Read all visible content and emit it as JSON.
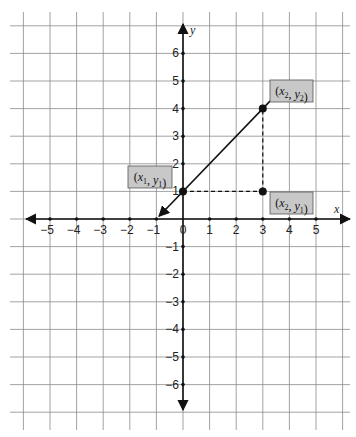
{
  "chart_data": {
    "type": "line",
    "title": "",
    "xlabel": "x",
    "ylabel": "y",
    "xlim": [
      -6,
      6
    ],
    "ylim": [
      -7,
      7
    ],
    "grid": true,
    "x_ticks": [
      "-5",
      "-4",
      "-3",
      "-2",
      "-1",
      "0",
      "1",
      "2",
      "3",
      "4",
      "5"
    ],
    "y_ticks_positive": [
      "1",
      "2",
      "3",
      "4",
      "5",
      "6"
    ],
    "y_ticks_negative": [
      "-1",
      "-2",
      "-3",
      "-4",
      "-5",
      "-6"
    ],
    "line": {
      "through": [
        [
          0,
          1
        ],
        [
          3,
          4
        ]
      ],
      "slope": 1,
      "arrows_both_ends": true
    },
    "points": [
      {
        "x": 0,
        "y": 1,
        "label_x": "x",
        "label_x_sub": "1",
        "label_y": "y",
        "label_y_sub": "1"
      },
      {
        "x": 3,
        "y": 4,
        "label_x": "x",
        "label_x_sub": "2",
        "label_y": "y",
        "label_y_sub": "2"
      },
      {
        "x": 3,
        "y": 1,
        "label_x": "x",
        "label_x_sub": "2",
        "label_y": "y",
        "label_y_sub": "1"
      }
    ],
    "dashed_segments": [
      {
        "from": [
          0,
          1
        ],
        "to": [
          3,
          1
        ]
      },
      {
        "from": [
          3,
          1
        ],
        "to": [
          3,
          4
        ]
      }
    ]
  },
  "colors": {
    "grid": "#8a8a8a",
    "axis": "#111111",
    "label_box": "#c8c8c8"
  }
}
